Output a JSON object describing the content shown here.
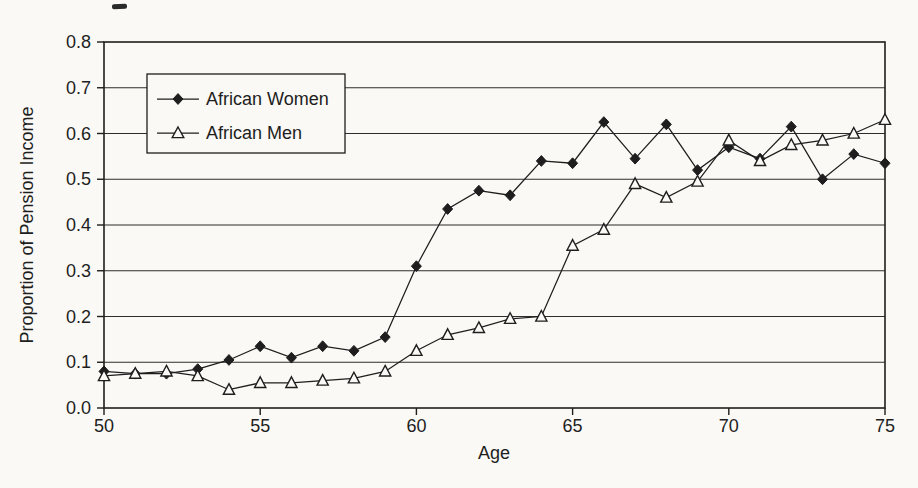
{
  "figure": {
    "background_color": "#faf9f5",
    "ink_color": "#1e1e1e"
  },
  "chart_data": {
    "type": "line",
    "title": "",
    "xlabel": "Age",
    "ylabel": "Proportion of Pension Income",
    "xlim": [
      50,
      75
    ],
    "ylim": [
      0.0,
      0.8
    ],
    "x_ticks": [
      "50",
      "55",
      "60",
      "65",
      "70",
      "75"
    ],
    "y_ticks": [
      "0.0",
      "0.1",
      "0.2",
      "0.3",
      "0.4",
      "0.5",
      "0.6",
      "0.7",
      "0.8"
    ],
    "grid": "horizontal",
    "legend_position": "top-left-inside",
    "x": [
      50,
      51,
      52,
      53,
      54,
      55,
      56,
      57,
      58,
      59,
      60,
      61,
      62,
      63,
      64,
      65,
      66,
      67,
      68,
      69,
      70,
      71,
      72,
      73,
      74,
      75
    ],
    "series": [
      {
        "name": "African Women",
        "marker": "filled-diamond",
        "color": "#1e1e1e",
        "values": [
          0.08,
          0.075,
          0.075,
          0.085,
          0.105,
          0.135,
          0.11,
          0.135,
          0.125,
          0.155,
          0.31,
          0.435,
          0.475,
          0.465,
          0.54,
          0.535,
          0.625,
          0.545,
          0.62,
          0.52,
          0.57,
          0.545,
          0.615,
          0.5,
          0.555,
          0.535
        ]
      },
      {
        "name": "African Men",
        "marker": "open-triangle",
        "color": "#1e1e1e",
        "values": [
          0.07,
          0.075,
          0.08,
          0.07,
          0.04,
          0.055,
          0.055,
          0.06,
          0.065,
          0.08,
          0.125,
          0.16,
          0.175,
          0.195,
          0.2,
          0.355,
          0.39,
          0.49,
          0.46,
          0.495,
          0.585,
          0.54,
          0.575,
          0.585,
          0.6,
          0.63
        ]
      }
    ]
  }
}
